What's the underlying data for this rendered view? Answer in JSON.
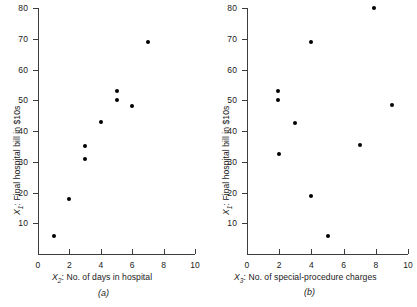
{
  "figure": {
    "panels": [
      {
        "caption": "(a)",
        "xlabel_var": "X",
        "xlabel_sub": "2",
        "xlabel_text": ": No. of days in hospital",
        "xlabel_full": "X2: No. of days in hospital",
        "ylabel_var": "X",
        "ylabel_sub": "1",
        "ylabel_text": ": Final hospital bill in $10s",
        "ylabel_full": "X1: Final hospital bill in $10s",
        "xticks": [
          "0",
          "2",
          "4",
          "6",
          "8",
          "10"
        ],
        "yticks": [
          "10",
          "20",
          "30",
          "40",
          "50",
          "60",
          "70",
          "80"
        ]
      },
      {
        "caption": "(b)",
        "xlabel_var": "X",
        "xlabel_sub": "3",
        "xlabel_text": ": No. of special-procedure charges",
        "xlabel_full": "X3: No. of special-procedure charges",
        "ylabel_var": "X",
        "ylabel_sub": "1",
        "ylabel_text": ": Final hospital bill in $10s",
        "ylabel_full": "X1: Final hospital bill in $10s",
        "xticks": [
          "0",
          "2",
          "4",
          "6",
          "8",
          "10"
        ],
        "yticks": [
          "10",
          "20",
          "30",
          "40",
          "50",
          "60",
          "70",
          "80"
        ]
      }
    ]
  },
  "chart_data": [
    {
      "type": "scatter",
      "title": "(a)",
      "xlabel": "X2: No. of days in hospital",
      "ylabel": "X1: Final hospital bill in $10s",
      "xlim": [
        0,
        10
      ],
      "ylim": [
        0,
        80
      ],
      "xticks": [
        0,
        2,
        4,
        6,
        8,
        10
      ],
      "yticks": [
        10,
        20,
        30,
        40,
        50,
        60,
        70,
        80
      ],
      "grid": false,
      "legend": null,
      "marker": "filled-circle",
      "marker_color": "#000000",
      "x": [
        1,
        2,
        3,
        3,
        4,
        5,
        5,
        6,
        7
      ],
      "y": [
        6,
        18,
        31,
        35,
        43,
        50,
        53,
        48,
        69
      ]
    },
    {
      "type": "scatter",
      "title": "(b)",
      "xlabel": "X3: No. of special-procedure charges",
      "ylabel": "X1: Final hospital bill in $10s",
      "xlim": [
        0,
        10
      ],
      "ylim": [
        0,
        80
      ],
      "xticks": [
        0,
        2,
        4,
        6,
        8,
        10
      ],
      "yticks": [
        10,
        20,
        30,
        40,
        50,
        60,
        70,
        80
      ],
      "grid": false,
      "legend": null,
      "marker": "filled-circle",
      "marker_color": "#000000",
      "x": [
        1.9,
        1.9,
        2,
        3,
        4,
        4,
        5,
        7,
        7.9,
        9
      ],
      "y": [
        53,
        50,
        32.5,
        42.5,
        69,
        19,
        6,
        35.5,
        80,
        48.5
      ]
    }
  ]
}
